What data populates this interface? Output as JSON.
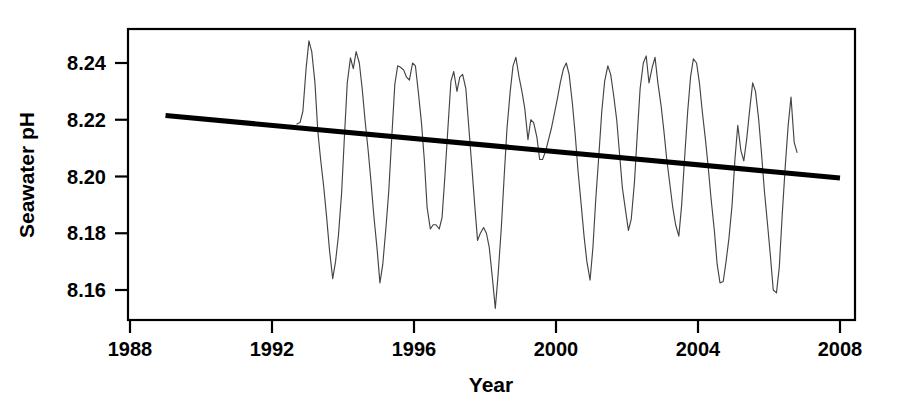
{
  "chart_data": {
    "type": "line",
    "title": "",
    "subtitle": "",
    "xlabel": "Year",
    "ylabel": "Seawater pH",
    "xlim": [
      1988.0,
      2008.0
    ],
    "ylim": [
      8.1505,
      8.2495
    ],
    "grid": false,
    "legend": null,
    "xticks": [
      1988,
      1992,
      1996,
      2000,
      2004,
      2008
    ],
    "xtick_labels": [
      "1988",
      "1992",
      "1996",
      "2000",
      "2004",
      "2008"
    ],
    "yticks": [
      8.16,
      8.18,
      8.2,
      8.22,
      8.24
    ],
    "ytick_labels": [
      "8.16",
      "8.18",
      "8.20",
      "8.22",
      "8.24"
    ],
    "series": [
      {
        "name": "Seawater pH monthly record",
        "style": "thin-line",
        "color": "#444444",
        "x": [
          1992.7,
          1992.79,
          1992.87,
          1992.96,
          1993.04,
          1993.12,
          1993.21,
          1993.29,
          1993.37,
          1993.46,
          1993.54,
          1993.62,
          1993.71,
          1993.79,
          1993.87,
          1993.96,
          1994.04,
          1994.12,
          1994.21,
          1994.29,
          1994.37,
          1994.46,
          1994.54,
          1994.62,
          1994.71,
          1994.79,
          1994.87,
          1994.96,
          1995.04,
          1995.12,
          1995.21,
          1995.29,
          1995.37,
          1995.46,
          1995.54,
          1995.62,
          1995.71,
          1995.79,
          1995.87,
          1995.96,
          1996.04,
          1996.12,
          1996.21,
          1996.29,
          1996.37,
          1996.46,
          1996.54,
          1996.62,
          1996.71,
          1996.79,
          1996.87,
          1996.96,
          1997.04,
          1997.12,
          1997.21,
          1997.29,
          1997.37,
          1997.46,
          1997.54,
          1997.62,
          1997.71,
          1997.79,
          1997.87,
          1997.96,
          1998.04,
          1998.12,
          1998.21,
          1998.29,
          1998.37,
          1998.46,
          1998.54,
          1998.62,
          1998.71,
          1998.79,
          1998.87,
          1998.96,
          1999.04,
          1999.12,
          1999.21,
          1999.29,
          1999.37,
          1999.46,
          1999.54,
          1999.62,
          1999.71,
          1999.79,
          1999.87,
          1999.96,
          2000.04,
          2000.12,
          2000.21,
          2000.29,
          2000.37,
          2000.46,
          2000.54,
          2000.62,
          2000.71,
          2000.79,
          2000.87,
          2000.96,
          2001.04,
          2001.12,
          2001.21,
          2001.29,
          2001.37,
          2001.46,
          2001.54,
          2001.62,
          2001.71,
          2001.79,
          2001.87,
          2001.96,
          2002.04,
          2002.12,
          2002.21,
          2002.29,
          2002.37,
          2002.46,
          2002.54,
          2002.62,
          2002.71,
          2002.79,
          2002.87,
          2002.96,
          2003.04,
          2003.12,
          2003.21,
          2003.29,
          2003.37,
          2003.46,
          2003.54,
          2003.62,
          2003.71,
          2003.79,
          2003.87,
          2003.96,
          2004.04,
          2004.12,
          2004.21,
          2004.29,
          2004.37,
          2004.46,
          2004.54,
          2004.62,
          2004.71,
          2004.79,
          2004.87,
          2004.96,
          2005.04,
          2005.12,
          2005.21,
          2005.29,
          2005.37,
          2005.46,
          2005.54,
          2005.62,
          2005.71,
          2005.79,
          2005.87,
          2005.96,
          2006.04,
          2006.12,
          2006.21,
          2006.29,
          2006.37,
          2006.46,
          2006.54,
          2006.62,
          2006.71,
          2006.79
        ],
        "y": [
          8.2185,
          8.219,
          8.223,
          8.238,
          8.2478,
          8.244,
          8.233,
          8.216,
          8.206,
          8.196,
          8.1855,
          8.174,
          8.164,
          8.17,
          8.179,
          8.194,
          8.214,
          8.233,
          8.2418,
          8.238,
          8.244,
          8.24,
          8.231,
          8.22,
          8.209,
          8.198,
          8.186,
          8.1745,
          8.1625,
          8.169,
          8.182,
          8.195,
          8.213,
          8.2325,
          8.239,
          8.2385,
          8.2375,
          8.235,
          8.234,
          8.24,
          8.239,
          8.23,
          8.219,
          8.206,
          8.189,
          8.1815,
          8.183,
          8.183,
          8.1815,
          8.1855,
          8.2,
          8.218,
          8.2335,
          8.237,
          8.23,
          8.235,
          8.236,
          8.231,
          8.218,
          8.205,
          8.19,
          8.1775,
          8.18,
          8.182,
          8.18,
          8.175,
          8.164,
          8.1535,
          8.1655,
          8.182,
          8.2,
          8.217,
          8.23,
          8.239,
          8.242,
          8.235,
          8.23,
          8.224,
          8.213,
          8.22,
          8.219,
          8.214,
          8.206,
          8.206,
          8.209,
          8.213,
          8.217,
          8.2225,
          8.2275,
          8.233,
          8.238,
          8.24,
          8.236,
          8.226,
          8.215,
          8.202,
          8.19,
          8.179,
          8.17,
          8.1635,
          8.175,
          8.192,
          8.208,
          8.223,
          8.2335,
          8.239,
          8.236,
          8.229,
          8.22,
          8.208,
          8.196,
          8.188,
          8.181,
          8.185,
          8.198,
          8.215,
          8.231,
          8.24,
          8.2425,
          8.233,
          8.2385,
          8.242,
          8.233,
          8.225,
          8.216,
          8.206,
          8.197,
          8.189,
          8.183,
          8.179,
          8.19,
          8.206,
          8.223,
          8.235,
          8.2415,
          8.24,
          8.233,
          8.223,
          8.213,
          8.203,
          8.192,
          8.181,
          8.169,
          8.1625,
          8.163,
          8.17,
          8.178,
          8.19,
          8.206,
          8.218,
          8.209,
          8.2055,
          8.213,
          8.224,
          8.233,
          8.23,
          8.22,
          8.208,
          8.195,
          8.183,
          8.172,
          8.16,
          8.159,
          8.168,
          8.186,
          8.204,
          8.218,
          8.228,
          8.212,
          8.2085
        ]
      }
    ],
    "trend": {
      "name": "Linear trend",
      "style": "thick-line",
      "color": "#000000",
      "x": [
        1989.0,
        2008.0
      ],
      "y": [
        8.2215,
        8.1995
      ],
      "slope_per_year": -0.001158
    }
  },
  "axes": {
    "x_title": "Year",
    "y_title": "Seawater pH"
  }
}
